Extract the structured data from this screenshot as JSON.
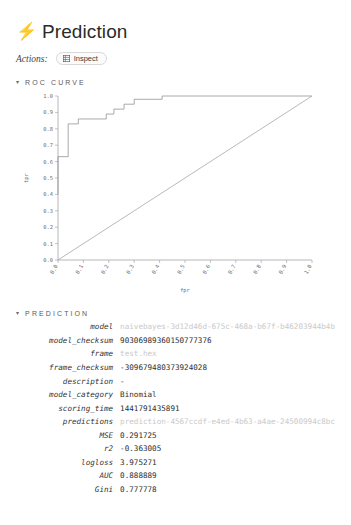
{
  "header": {
    "icon": "bolt-icon",
    "title": "Prediction",
    "actions_label": "Actions:",
    "inspect_button": "Inspect",
    "inspect_icon": "grid-icon"
  },
  "sections": {
    "roc": {
      "caret": "▾",
      "label": "ROC CURVE"
    },
    "prediction": {
      "caret": "▾",
      "label": "PREDICTION"
    }
  },
  "chart_data": {
    "type": "line",
    "title": "",
    "xlabel": "fpr",
    "ylabel": "tpr",
    "xlim": [
      0,
      1
    ],
    "ylim": [
      0,
      1
    ],
    "grid": false,
    "legend": "none",
    "xticks": [
      "0.0",
      "0.1",
      "0.2",
      "0.3",
      "0.4",
      "0.5",
      "0.6",
      "0.7",
      "0.8",
      "0.9",
      "1.0"
    ],
    "yticks": [
      "0.0",
      "0.1",
      "0.2",
      "0.3",
      "0.4",
      "0.5",
      "0.6",
      "0.7",
      "0.8",
      "0.9",
      "1.0"
    ],
    "series": [
      {
        "name": "roc",
        "x": [
          0.0,
          0.0,
          0.04,
          0.04,
          0.08,
          0.08,
          0.19,
          0.19,
          0.22,
          0.22,
          0.26,
          0.26,
          0.3,
          0.3,
          0.41,
          0.41,
          1.0
        ],
        "y": [
          0.4,
          0.63,
          0.63,
          0.83,
          0.83,
          0.86,
          0.86,
          0.89,
          0.89,
          0.92,
          0.92,
          0.95,
          0.95,
          0.98,
          0.98,
          1.0,
          1.0
        ]
      },
      {
        "name": "chance",
        "x": [
          0.0,
          1.0
        ],
        "y": [
          0.0,
          1.0
        ]
      }
    ]
  },
  "prediction": {
    "rows": [
      {
        "key": "model",
        "value": "naivebayes-3d12d46d-675c-468a-b67f-b46203944b4b",
        "muted": true
      },
      {
        "key": "model_checksum",
        "value": "90306989360150777376",
        "muted": false
      },
      {
        "key": "frame",
        "value": "test.hex",
        "muted": true
      },
      {
        "key": "frame_checksum",
        "value": "-309679480373924028",
        "muted": false
      },
      {
        "key": "description",
        "value": "-",
        "muted": false
      },
      {
        "key": "model_category",
        "value": "Binomial",
        "muted": false
      },
      {
        "key": "scoring_time",
        "value": "1441791435891",
        "muted": false
      },
      {
        "key": "predictions",
        "value": "prediction-4567ccdf-e4ed-4b63-a4ae-24500994c8bc",
        "muted": true
      },
      {
        "key": "MSE",
        "value": "0.291725",
        "muted": false
      },
      {
        "key": "r2",
        "value": "-0.363005",
        "muted": false
      },
      {
        "key": "logloss",
        "value": "3.975271",
        "muted": false
      },
      {
        "key": "AUC",
        "value": "0.888889",
        "muted": false
      },
      {
        "key": "Gini",
        "value": "0.777778",
        "muted": false
      }
    ]
  },
  "colors": {
    "text": "#2d2d2d",
    "muted": "#c9c9c9",
    "axis": "#9a9a9a",
    "curve": "#8d8d8d"
  }
}
